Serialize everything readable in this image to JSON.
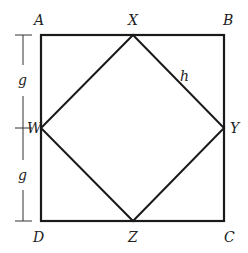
{
  "diagram": {
    "type": "geometry",
    "colors": {
      "stroke": "#1a1a1a",
      "background": "#ffffff",
      "text": "#222222"
    },
    "vertices": {
      "A": "A",
      "B": "B",
      "C": "C",
      "D": "D",
      "X": "X",
      "Y": "Y",
      "Z": "Z",
      "W": "W"
    },
    "edge_labels": {
      "XY": "h"
    },
    "dimension_labels": {
      "AW": "g",
      "WD": "g"
    }
  }
}
